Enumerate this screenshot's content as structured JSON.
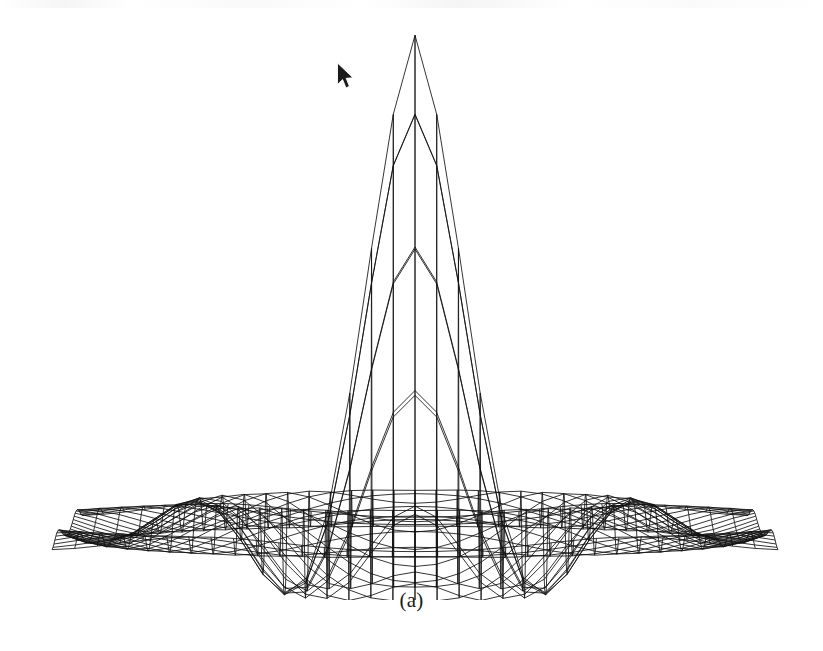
{
  "figure": {
    "caption": "(a)",
    "kind": "3d-wireframe-mesh-surface",
    "background_color": "#ffffff",
    "line_color": "#111111"
  },
  "cursor": {
    "name": "arrow-pointer",
    "x": 336,
    "y": 62,
    "width": 17,
    "height": 26,
    "fill": "#1b1b1b",
    "outline": "#ffffff"
  },
  "chart_data": {
    "type": "line",
    "title": "(a)",
    "xlabel": "",
    "ylabel": "",
    "grid": true,
    "legend": null,
    "surface": {
      "function": "radially-symmetric-sinc-like-peak",
      "grid_nx": 41,
      "grid_ny": 41,
      "x_range": [
        -4.0,
        4.0
      ],
      "y_range": [
        -4.0,
        4.0
      ],
      "z_range": [
        -0.22,
        1.0
      ],
      "peak_value": 1.0,
      "peak_position": [
        0.0,
        0.0
      ],
      "main_lobe_half_width": 1.05,
      "side_lobe_count": 3,
      "side_lobe_peak_values": [
        0.11,
        0.045,
        0.02
      ],
      "side_lobe_trough_values": [
        -0.22,
        -0.06,
        -0.03
      ]
    },
    "view": {
      "azimuth_deg": 0,
      "elevation_deg": 6,
      "projection": "parallel",
      "x_axis_pixel_span": [
        52,
        778
      ],
      "z_axis_pixel_top": 37,
      "baseline_pixel_y": 545,
      "depth_pixel_shift_y": 34,
      "depth_pixel_shift_x": 0
    },
    "ridge_apex_pixel_y": [
      37,
      80,
      120,
      172,
      294,
      418,
      508
    ],
    "vertical_gridline_pixel_x": [
      194,
      231,
      268,
      305,
      341,
      378,
      415,
      452,
      489,
      526,
      563,
      600,
      637
    ],
    "categories": [],
    "values": []
  },
  "render_params": {
    "mesh_rows": 33,
    "mesh_cols": 33,
    "row_stroke_width": 0.85,
    "col_stroke_width": 0.85,
    "ridge_stroke_width": 1.0
  }
}
